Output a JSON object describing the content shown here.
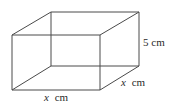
{
  "figure": {
    "type": "cuboid",
    "line_color": "#4a4a4a",
    "background": "#ffffff",
    "labels": {
      "height": {
        "value": "5",
        "unit": "cm",
        "text": "5 cm"
      },
      "width_front": {
        "variable": "x",
        "unit": "cm",
        "text": "x cm"
      },
      "depth_side": {
        "variable": "x",
        "unit": "cm",
        "text": "x cm"
      }
    },
    "vertices": {
      "front_top_left": [
        12,
        35
      ],
      "front_top_right": [
        100,
        35
      ],
      "front_bottom_left": [
        12,
        90
      ],
      "front_bottom_right": [
        100,
        90
      ],
      "back_top_left": [
        51,
        12
      ],
      "back_top_right": [
        139,
        12
      ],
      "back_bottom_left": [
        51,
        66
      ],
      "back_bottom_right": [
        139,
        66
      ]
    }
  }
}
